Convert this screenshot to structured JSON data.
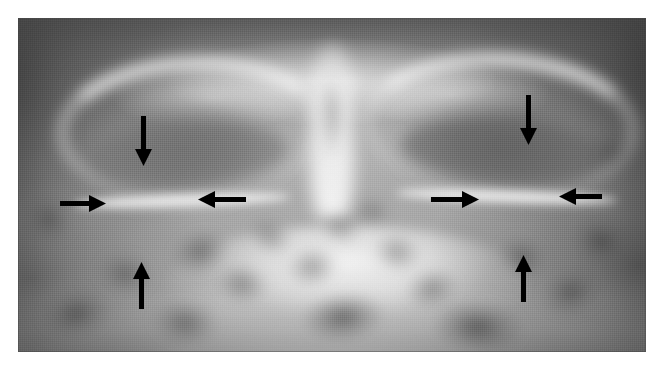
{
  "figure": {
    "kind": "radiograph",
    "modality": "plain-film-radiograph",
    "view": "occipitomental (Waters) paranasal sinus / orbits",
    "region": "facial bones, orbits and maxillary sinuses",
    "caption": "",
    "plate": {
      "x": 18,
      "y": 18,
      "width": 628,
      "height": 334,
      "background_color": "#8c8c8c",
      "page_background_color": "#ffffff"
    },
    "palette": {
      "film_dark": "#3a3a3a",
      "film_mid": "#8c8c8c",
      "film_bright": "#fcfcfc",
      "annotation_color": "#000000",
      "page_background": "#ffffff"
    },
    "anatomy_labels": [
      "superior orbital rim",
      "orbital lucency",
      "orbital floor",
      "nasal septum",
      "maxillary antrum",
      "petrous ridge"
    ],
    "annotations": {
      "count": 8,
      "color": "#000000",
      "arrows": [
        {
          "id": "left-superior-arrow",
          "name": "arrow-down-left-orbit",
          "direction": "down",
          "x": 135,
          "y": 116,
          "length": 50,
          "points_at": "superior margin of left orbital lesion"
        },
        {
          "id": "left-lateral-arrow",
          "name": "arrow-right-left-orbit",
          "direction": "right",
          "x": 60,
          "y": 195,
          "length": 46,
          "points_at": "lateral margin of left orbital lesion"
        },
        {
          "id": "left-medial-arrow",
          "name": "arrow-left-left-orbit",
          "direction": "left",
          "x": 198,
          "y": 191,
          "length": 48,
          "points_at": "medial margin of left orbital lesion"
        },
        {
          "id": "left-inferior-arrow",
          "name": "arrow-up-left-orbit",
          "direction": "up",
          "x": 133,
          "y": 262,
          "length": 47,
          "points_at": "inferior margin of left orbital lesion"
        },
        {
          "id": "right-superior-arrow",
          "name": "arrow-down-right-orbit",
          "direction": "down",
          "x": 520,
          "y": 95,
          "length": 50,
          "points_at": "superior margin of right orbital lesion"
        },
        {
          "id": "right-lateral-arrow",
          "name": "arrow-right-right-orbit",
          "direction": "right",
          "x": 431,
          "y": 191,
          "length": 48,
          "points_at": "medial margin of right orbital lesion"
        },
        {
          "id": "right-medial-arrow",
          "name": "arrow-left-right-orbit",
          "direction": "left",
          "x": 559,
          "y": 188,
          "length": 43,
          "points_at": "lateral margin of right orbital lesion"
        },
        {
          "id": "right-inferior-arrow",
          "name": "arrow-up-right-orbit",
          "direction": "up",
          "x": 515,
          "y": 255,
          "length": 47,
          "points_at": "inferior margin of right orbital lesion"
        }
      ]
    },
    "dark_blobs": [
      {
        "x": 170,
        "y": 230,
        "w": 62,
        "h": 44,
        "opacity": 0.46,
        "rot": -18
      },
      {
        "x": 214,
        "y": 264,
        "w": 56,
        "h": 40,
        "opacity": 0.4,
        "rot": 12
      },
      {
        "x": 246,
        "y": 218,
        "w": 48,
        "h": 36,
        "opacity": 0.34,
        "rot": 26
      },
      {
        "x": 286,
        "y": 246,
        "w": 52,
        "h": 42,
        "opacity": 0.38,
        "rot": -8
      },
      {
        "x": 318,
        "y": 210,
        "w": 44,
        "h": 34,
        "opacity": 0.32,
        "rot": 18
      },
      {
        "x": 300,
        "y": 292,
        "w": 86,
        "h": 50,
        "opacity": 0.58,
        "rot": -6
      },
      {
        "x": 372,
        "y": 232,
        "w": 50,
        "h": 40,
        "opacity": 0.36,
        "rot": 14
      },
      {
        "x": 404,
        "y": 268,
        "w": 56,
        "h": 42,
        "opacity": 0.4,
        "rot": -14
      },
      {
        "x": 430,
        "y": 300,
        "w": 96,
        "h": 54,
        "opacity": 0.6,
        "rot": 5
      },
      {
        "x": 496,
        "y": 236,
        "w": 52,
        "h": 42,
        "opacity": 0.42,
        "rot": 20
      },
      {
        "x": 540,
        "y": 268,
        "w": 62,
        "h": 48,
        "opacity": 0.5,
        "rot": -10
      },
      {
        "x": 572,
        "y": 218,
        "w": 58,
        "h": 46,
        "opacity": 0.52,
        "rot": 16
      },
      {
        "x": 96,
        "y": 252,
        "w": 58,
        "h": 44,
        "opacity": 0.4,
        "rot": 10
      },
      {
        "x": 40,
        "y": 288,
        "w": 72,
        "h": 50,
        "opacity": 0.52,
        "rot": -12
      },
      {
        "x": 150,
        "y": 300,
        "w": 70,
        "h": 46,
        "opacity": 0.46,
        "rot": 8
      },
      {
        "x": 22,
        "y": 196,
        "w": 54,
        "h": 46,
        "opacity": 0.42,
        "rot": 22
      },
      {
        "x": 586,
        "y": 130,
        "w": 50,
        "h": 44,
        "opacity": 0.38,
        "rot": -20
      },
      {
        "x": 352,
        "y": 196,
        "w": 40,
        "h": 30,
        "opacity": 0.3,
        "rot": 0
      }
    ]
  }
}
